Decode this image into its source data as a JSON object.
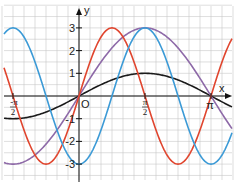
{
  "axes": {
    "x_label": "x",
    "y_label": "y",
    "origin_label": "O",
    "y_ticks": [
      {
        "value": 3,
        "label": "3"
      },
      {
        "value": 2,
        "label": "2"
      },
      {
        "value": 1,
        "label": "1"
      },
      {
        "value": -1,
        "label": "-1"
      },
      {
        "value": -2,
        "label": "-2"
      },
      {
        "value": -3,
        "label": "-3"
      }
    ],
    "x_ticks": [
      {
        "value": -1.5708,
        "num": "π",
        "den": "2",
        "sign": "-"
      },
      {
        "value": 1.5708,
        "num": "π",
        "den": "2",
        "sign": ""
      },
      {
        "value": 3.1416,
        "label": "π"
      }
    ]
  },
  "curves": [
    {
      "name": "sin",
      "expr": "sin(x)",
      "color": "#1a1a1a"
    },
    {
      "name": "3sin",
      "expr": "3*sin(x)",
      "color": "#8e6aa8"
    },
    {
      "name": "3sin2x",
      "expr": "3*sin(2x)",
      "color": "#e0452e"
    },
    {
      "name": "neg3cos2x",
      "expr": "-3*cos(2x)",
      "color": "#3b9ad6"
    }
  ],
  "grid_color": "#c8c8c8"
}
